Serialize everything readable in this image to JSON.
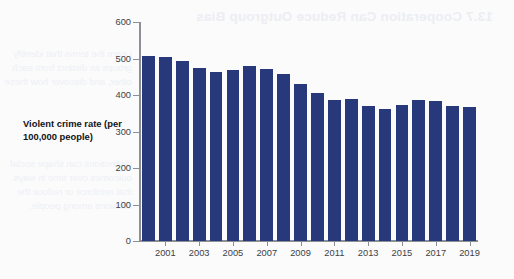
{
  "chart_data": {
    "type": "bar",
    "title": "",
    "xlabel": "",
    "ylabel": "Violent crime rate (per 100,000 people)",
    "ylim": [
      0,
      600
    ],
    "yticks": [
      0,
      100,
      200,
      300,
      400,
      500,
      600
    ],
    "ytick_labels": [
      "0",
      "100",
      "200",
      "300",
      "400",
      "500",
      "600"
    ],
    "grid": false,
    "legend": false,
    "bar_color": "#27387b",
    "xtick_labels": [
      "2001",
      "2003",
      "2005",
      "2007",
      "2009",
      "2011",
      "2013",
      "2015",
      "2017",
      "2019"
    ],
    "categories": [
      "2000",
      "2001",
      "2002",
      "2003",
      "2004",
      "2005",
      "2006",
      "2007",
      "2008",
      "2009",
      "2010",
      "2011",
      "2012",
      "2013",
      "2014",
      "2015",
      "2016",
      "2017",
      "2018",
      "2019"
    ],
    "values": [
      506,
      505,
      494,
      475,
      463,
      469,
      479,
      472,
      458,
      431,
      405,
      387,
      388,
      370,
      362,
      374,
      386,
      383,
      370,
      366
    ]
  },
  "caption": {
    "y_axis_label": "Violent crime rate (per 100,000 people)"
  },
  "bleed_through": {
    "heading": "13.7 Cooperation Can Reduce Outgroup Bias",
    "lines": [
      "Learn the terms that identify",
      "groups as distinct from each",
      "other, and discover how these",
      "distinctions can shape social",
      "outcomes over time in ways",
      "that reinforce or reduce the",
      "divisions among people."
    ]
  }
}
